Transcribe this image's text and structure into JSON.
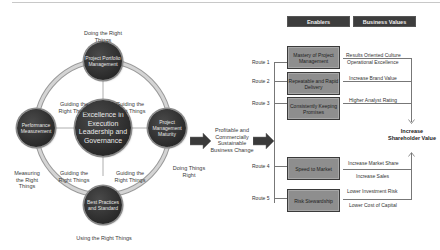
{
  "cycle": {
    "center": "Excellence in Execution Leadership and Governance",
    "nodes": {
      "top": "Project Portfolio Management",
      "left": "Performance Measurement",
      "right": "Project Management Maturity",
      "bottom": "Best Practices and Standard"
    },
    "outer_labels": {
      "top": "Doing the Right Things",
      "left": "Measuring the Right Things",
      "right": "Doing Things Right",
      "bottom": "Using the Right Things"
    },
    "guiding_labels": [
      "Guiding the Right Things",
      "Guiding the Right Things",
      "Guiding the Right Things",
      "Guiding the Right Things"
    ]
  },
  "middle": {
    "text": "Profitable and Commercially Sustainable Business Change"
  },
  "headers": {
    "enablers": "Enablers",
    "business_values": "Business Values"
  },
  "routes": [
    {
      "label": "Route 1",
      "enabler": "Mastery of Project Management",
      "values": [
        "Results Oriented Culture",
        "Operational Excellence"
      ]
    },
    {
      "label": "Route 2",
      "enabler": "Repeatable and Rapid Delivery",
      "values": [
        "Increase Brand Value"
      ]
    },
    {
      "label": "Route 3",
      "enabler": "Consistently Keeping Promises",
      "values": [
        "Higher Analyst Rating"
      ]
    },
    {
      "label": "Route 4",
      "enabler": "Speed to Market",
      "values": [
        "Increase Market Share",
        "Increase Sales"
      ]
    },
    {
      "label": "Route 5",
      "enabler": "Risk Stewardship",
      "values": [
        "Lower Investment Risk",
        "Lower Cost of Capital"
      ]
    }
  ],
  "outcome": "Increase Shareholder Value",
  "colors": {
    "circle": "#2e2e2e",
    "ring": "#b0b0b0",
    "header": "#3d3d3d",
    "enabler_box": "#8e8e8e"
  }
}
